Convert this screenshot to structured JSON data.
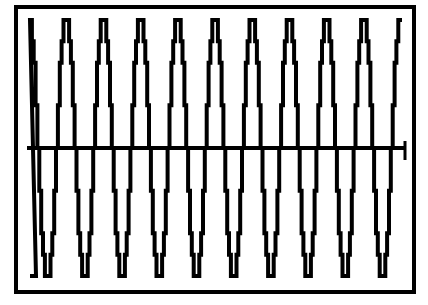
{
  "chart_data": {
    "type": "line",
    "title": "",
    "xlabel": "",
    "ylabel": "",
    "grid": false,
    "legend": [],
    "cycles": 10,
    "ylim": [
      -1,
      1
    ],
    "x": [
      0,
      0.5,
      1,
      1.5,
      2,
      2.5,
      3,
      3.5,
      4,
      4.5,
      5,
      5.5,
      6,
      6.5,
      7,
      7.5,
      8,
      8.5,
      9,
      9.5,
      10
    ],
    "series": [
      {
        "name": "waveform",
        "values": [
          1,
          -1,
          1,
          -1,
          1,
          -1,
          1,
          -1,
          1,
          -1,
          1,
          -1,
          1,
          -1,
          1,
          -1,
          1,
          -1,
          1,
          -1,
          1
        ]
      }
    ],
    "colors": {
      "line": "#000000",
      "background": "#ffffff",
      "frame": "#000000"
    }
  }
}
